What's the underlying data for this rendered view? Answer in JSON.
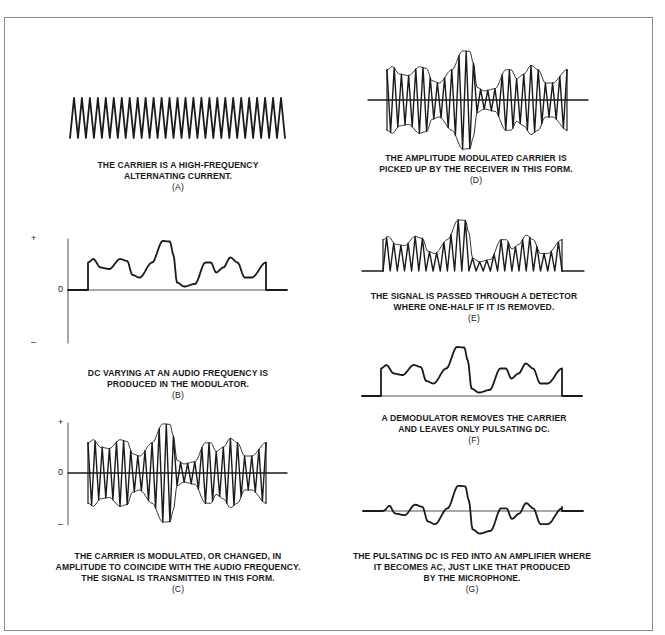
{
  "panels": {
    "A": {
      "caption_lines": [
        "THE CARRIER IS A HIGH-FREQUENCY",
        "ALTERNATING CURRENT."
      ],
      "label": "(A)"
    },
    "B": {
      "caption_lines": [
        "DC VARYING AT AN AUDIO FREQUENCY IS",
        "PRODUCED IN THE MODULATOR."
      ],
      "label": "(B)",
      "axis": {
        "plus": "+",
        "zero": "0",
        "minus": "–"
      }
    },
    "C": {
      "caption_lines": [
        "THE CARRIER IS MODULATED, OR CHANGED, IN",
        "AMPLITUDE TO COINCIDE WITH THE AUDIO FREQUENCY.",
        "THE SIGNAL IS TRANSMITTED IN THIS FORM."
      ],
      "label": "(C)",
      "axis": {
        "plus": "+",
        "zero": "0",
        "minus": "–"
      }
    },
    "D": {
      "caption_lines": [
        "THE AMPLITUDE MODULATED CARRIER IS",
        "PICKED UP BY THE RECEIVER IN THIS FORM."
      ],
      "label": "(D)"
    },
    "E": {
      "caption_lines": [
        "THE SIGNAL IS PASSED THROUGH A DETECTOR",
        "WHERE ONE-HALF IF IT IS REMOVED."
      ],
      "label": "(E)"
    },
    "F": {
      "caption_lines": [
        "A DEMODULATOR REMOVES THE CARRIER",
        "AND LEAVES ONLY PULSATING DC."
      ],
      "label": "(F)"
    },
    "G": {
      "caption_lines": [
        "THE PULSATING DC IS FED INTO AN AMPLIFIER WHERE",
        "IT BECOMES AC, JUST LIKE THAT PRODUCED",
        "BY THE MICROPHONE."
      ],
      "label": "(G)"
    }
  },
  "colors": {
    "ink": "#1a1a1a",
    "frame": "#8a8a8a",
    "axis": "#555555"
  }
}
